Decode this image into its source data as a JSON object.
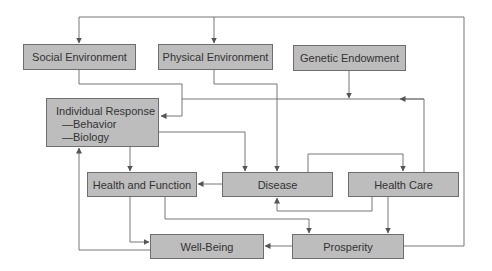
{
  "diagram": {
    "title": "",
    "colors": {
      "box_fill": "#bdbdbd",
      "box_border": "#6e6e6e",
      "line": "#666666",
      "text": "#333333"
    },
    "nodes": [
      {
        "id": "social",
        "label": "Social Environment"
      },
      {
        "id": "physical",
        "label": "Physical Environment"
      },
      {
        "id": "genetic",
        "label": "Genetic Endowment"
      },
      {
        "id": "individual",
        "label": "Individual Response",
        "sub": [
          "—Behavior",
          "—Biology"
        ]
      },
      {
        "id": "health_function",
        "label": "Health and Function"
      },
      {
        "id": "disease",
        "label": "Disease"
      },
      {
        "id": "health_care",
        "label": "Health Care"
      },
      {
        "id": "well_being",
        "label": "Well-Being"
      },
      {
        "id": "prosperity",
        "label": "Prosperity"
      }
    ],
    "edges": [
      {
        "from": "prosperity",
        "to": "social"
      },
      {
        "from": "prosperity",
        "to": "physical"
      },
      {
        "from": "social",
        "to": "individual"
      },
      {
        "from": "physical",
        "to": "disease"
      },
      {
        "from": "genetic",
        "to": "disease"
      },
      {
        "from": "health_care",
        "to": "individual"
      },
      {
        "from": "individual",
        "to": "health_function"
      },
      {
        "from": "individual",
        "to": "disease"
      },
      {
        "from": "disease",
        "to": "health_function"
      },
      {
        "from": "disease",
        "to": "health_care"
      },
      {
        "from": "health_care",
        "to": "disease"
      },
      {
        "from": "health_care",
        "to": "prosperity"
      },
      {
        "from": "health_function",
        "to": "well_being"
      },
      {
        "from": "health_function",
        "to": "prosperity"
      },
      {
        "from": "prosperity",
        "to": "well_being"
      },
      {
        "from": "well_being",
        "to": "individual"
      }
    ]
  }
}
